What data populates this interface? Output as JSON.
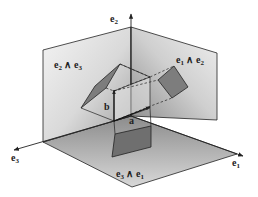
{
  "diagram": {
    "axes": {
      "e1": {
        "base": "e",
        "sub": "1"
      },
      "e2": {
        "base": "e",
        "sub": "2"
      },
      "e3": {
        "base": "e",
        "sub": "3"
      }
    },
    "planes": {
      "e2_e3": {
        "a": "e",
        "a_sub": "2",
        "op": " ∧ ",
        "b": "e",
        "b_sub": "3"
      },
      "e1_e2": {
        "a": "e",
        "a_sub": "1",
        "op": " ∧ ",
        "b": "e",
        "b_sub": "2"
      },
      "e3_e1": {
        "a": "e",
        "a_sub": "3",
        "op": " ∧ ",
        "b": "e",
        "b_sub": "1"
      }
    },
    "vectors": {
      "a": "a",
      "b": "b"
    },
    "colors": {
      "plane_light": "#f2f2f2",
      "plane_dark": "#9a9a9a",
      "projection_fill": "#7d7d7d",
      "line": "#222222"
    }
  }
}
